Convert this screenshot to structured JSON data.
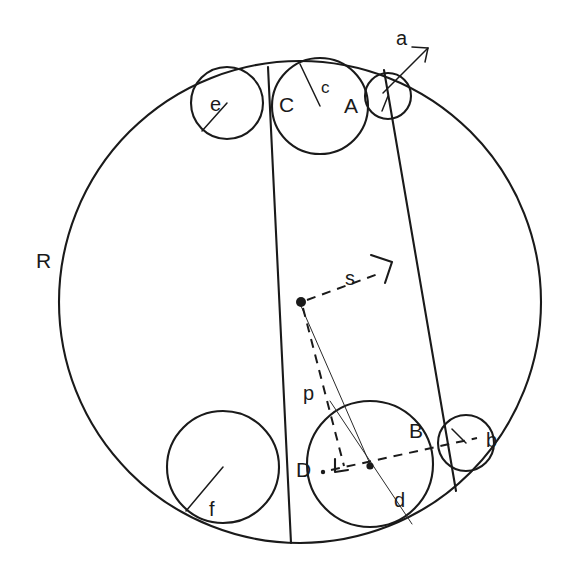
{
  "figure": {
    "background_color": "#ffffff",
    "stroke_color": "#1a1a1a",
    "labels": {
      "outer_radius": "R",
      "circle_a": "a",
      "circle_b": "b",
      "circle_c": "c",
      "circle_d": "d",
      "circle_e": "e",
      "circle_f": "f",
      "point_a": "A",
      "point_b": "B",
      "point_c": "C",
      "point_d": "D",
      "segment_s": "s",
      "segment_p": "p"
    },
    "geometry": {
      "outer_circle": {
        "cx": 300,
        "cy": 302,
        "r": 241
      },
      "center_dot": {
        "cx": 300,
        "cy": 302,
        "r": 4.5
      },
      "inner_circles": [
        {
          "name": "e",
          "cx": 227,
          "cy": 103,
          "r": 36
        },
        {
          "name": "A",
          "cx": 320,
          "cy": 106,
          "r": 48
        },
        {
          "name": "a",
          "cx": 388,
          "cy": 96,
          "r": 23
        },
        {
          "name": "f",
          "cx": 223,
          "cy": 467,
          "r": 56
        },
        {
          "name": "D",
          "cx": 370,
          "cy": 464,
          "r": 63
        },
        {
          "name": "b",
          "cx": 466,
          "cy": 443,
          "r": 28
        }
      ],
      "chord_left": {
        "x1": 268,
        "y1": 67,
        "x2": 291,
        "y2": 543
      },
      "chord_right": {
        "x1": 384,
        "y1": 70,
        "x2": 456,
        "y2": 491
      },
      "segment_d": {
        "x1": 330,
        "y1": 401,
        "x2": 412,
        "y2": 524
      },
      "dash_s": {
        "x1": 306,
        "y1": 300,
        "x2": 381,
        "y2": 273
      },
      "dash_p": {
        "x1": 302,
        "y1": 307,
        "x2": 343,
        "y2": 466
      },
      "dash_horizontal": {
        "x1": 330,
        "y1": 470,
        "x2": 476,
        "y2": 439
      },
      "hair_to_center": {
        "x1": 301,
        "y1": 306,
        "x2": 370,
        "y2": 464
      },
      "arrow_a": {
        "tail_x": 418,
        "tail_y": 43,
        "tip_x": 383,
        "tip_y": 93
      }
    }
  },
  "label_positions": {
    "R": {
      "x": 36,
      "y": 268
    },
    "a": {
      "x": 396,
      "y": 45
    },
    "b": {
      "x": 486,
      "y": 446
    },
    "c": {
      "x": 326,
      "y": 92
    },
    "d": {
      "x": 396,
      "y": 505
    },
    "e": {
      "x": 213,
      "y": 112
    },
    "f": {
      "x": 212,
      "y": 515
    },
    "A": {
      "x": 345,
      "y": 112
    },
    "B": {
      "x": 413,
      "y": 437
    },
    "C": {
      "x": 281,
      "y": 110
    },
    "D": {
      "x": 300,
      "y": 475
    },
    "p": {
      "x": 305,
      "y": 398
    },
    "s": {
      "x": 349,
      "y": 284
    }
  }
}
